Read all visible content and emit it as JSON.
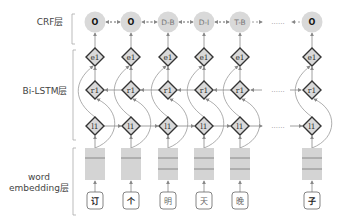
{
  "layers": {
    "crf": "CRF层",
    "bilstm": "Bi-LSTM层",
    "embedding_line1": "word",
    "embedding_line2": "embedding层"
  },
  "columns": [
    {
      "x": 95,
      "tag": "O",
      "tag_bold": true,
      "char": "订",
      "char_bold": true
    },
    {
      "x": 131,
      "tag": "O",
      "tag_bold": true,
      "char": "个",
      "char_bold": true
    },
    {
      "x": 168,
      "tag": "D-B",
      "tag_bold": false,
      "char": "明",
      "char_bold": false
    },
    {
      "x": 204,
      "tag": "D-I",
      "tag_bold": false,
      "char": "天",
      "char_bold": false
    },
    {
      "x": 240,
      "tag": "T-B",
      "tag_bold": false,
      "char": "晚",
      "char_bold": false
    },
    {
      "x": 312,
      "tag": "O",
      "tag_bold": true,
      "char": "子",
      "char_bold": true
    }
  ],
  "node_labels": {
    "emission": "e1",
    "backward": "r1",
    "forward": "l1"
  },
  "ellipsis": "......",
  "colors": {
    "node_fill": "#d9d9d9",
    "node_stroke": "#333333",
    "arrow": "#888888",
    "embed_fill": "#d4d4d4",
    "embed_line": "#777777"
  }
}
